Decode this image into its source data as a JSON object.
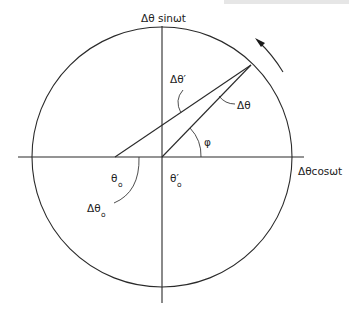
{
  "diagram": {
    "type": "phasor-circle",
    "axes": {
      "vertical_label": "Δθ sinωt",
      "horizontal_label": "Δθcosωt"
    },
    "labels": {
      "delta_theta_prime": "Δθ′",
      "delta_theta": "Δθ",
      "phi": "φ",
      "theta_o": "θ",
      "theta_o_sub": "o",
      "theta_o_prime": "θ′",
      "theta_o_prime_sub": "o",
      "delta_theta_o": "Δθ",
      "delta_theta_o_sub": "o"
    },
    "rotation_direction": "counter-clockwise",
    "geometry": {
      "center": [
        162,
        157
      ],
      "radius": 130,
      "phasor_tip": [
        251,
        65
      ],
      "offset_origin": [
        115,
        157
      ]
    }
  }
}
